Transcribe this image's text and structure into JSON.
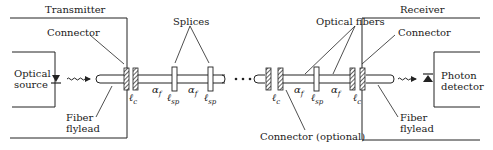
{
  "diagram": {
    "blocks": {
      "transmitter": "Transmitter",
      "receiver": "Receiver",
      "source_line1": "Optical",
      "source_line2": "source",
      "detector_line1": "Photon",
      "detector_line2": "detector"
    },
    "labels": {
      "connector_left": "Connector",
      "connector_right": "Connector",
      "splices": "Splices",
      "optical_fibers": "Optical fibers",
      "flylead_left_1": "Fiber",
      "flylead_left_2": "flylead",
      "flylead_right_1": "Fiber",
      "flylead_right_2": "flylead",
      "connector_optional": "Connector (optional)",
      "ellipsis": "• • •"
    },
    "symbols": {
      "loss_connector": "ℓ",
      "loss_connector_sub": "c",
      "loss_splice": "ℓ",
      "loss_splice_sub": "sp",
      "attenuation": "α",
      "attenuation_sub": "f"
    },
    "colors": {
      "stroke": "#1a1a1a",
      "background": "#ffffff"
    }
  }
}
